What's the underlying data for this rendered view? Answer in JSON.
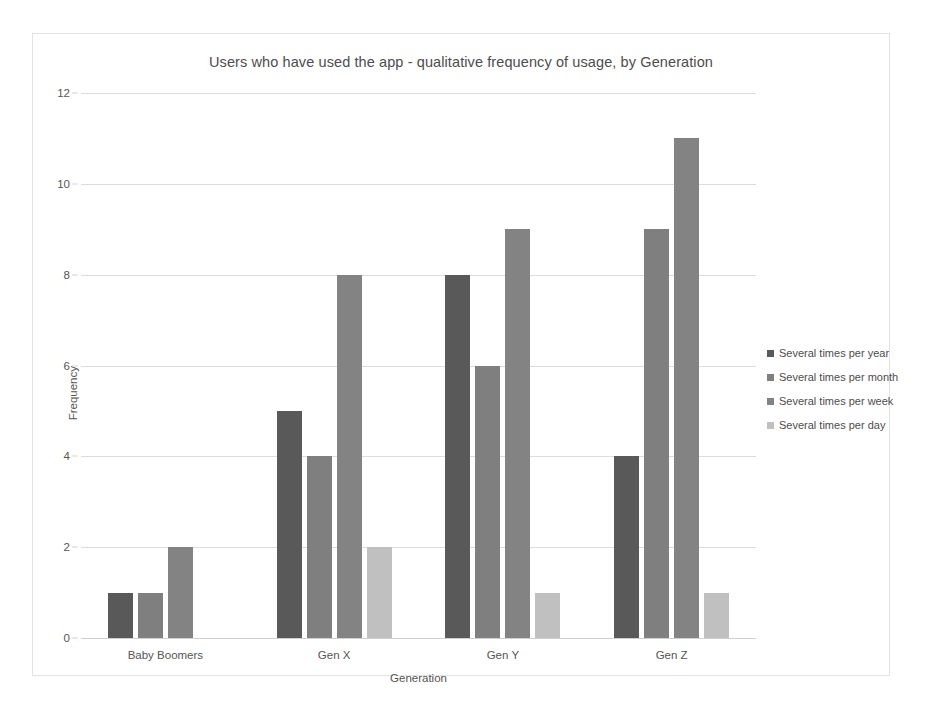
{
  "chart_data": {
    "type": "bar",
    "title": "Users who have used the app - qualitative frequency of usage, by Generation",
    "xlabel": "Generation",
    "ylabel": "Frequency",
    "categories": [
      "Baby Boomers",
      "Gen X",
      "Gen Y",
      "Gen Z"
    ],
    "series": [
      {
        "name": "Several times per year",
        "color": "#595959",
        "values": [
          1,
          5,
          8,
          4
        ]
      },
      {
        "name": "Several times per month",
        "color": "#7f7f7f",
        "values": [
          1,
          4,
          6,
          9
        ]
      },
      {
        "name": "Several times per week",
        "color": "#838383",
        "values": [
          2,
          8,
          9,
          11
        ]
      },
      {
        "name": "Several times per day",
        "color": "#c0c0c0",
        "values": [
          0,
          2,
          1,
          1
        ]
      }
    ],
    "ylim": [
      0,
      12
    ],
    "ytick_step": 2,
    "yticks": [
      "0",
      "2",
      "4",
      "6",
      "8",
      "10",
      "12"
    ],
    "grid": true,
    "legend_position": "right",
    "frame_border_color": "#e2e2e2",
    "gridline_color": "#dcdcdc",
    "text_color": "#4d4d4d"
  }
}
